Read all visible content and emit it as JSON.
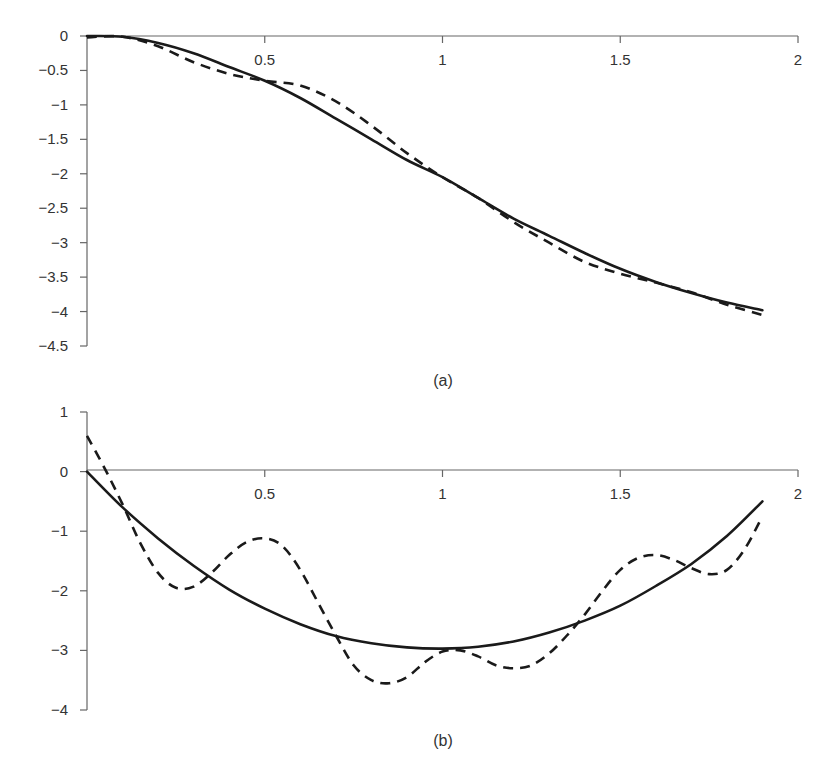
{
  "chart_data": [
    {
      "id": "a",
      "type": "line",
      "title": "",
      "caption": "(a)",
      "xlabel": "",
      "ylabel": "",
      "xlim": [
        0,
        2
      ],
      "ylim": [
        -4.5,
        0
      ],
      "x_ticks": [
        0.5,
        1,
        1.5,
        2
      ],
      "x_tick_labels": [
        "0.5",
        "1",
        "1.5",
        "2"
      ],
      "y_ticks": [
        0,
        -0.5,
        -1,
        -1.5,
        -2,
        -2.5,
        -3,
        -3.5,
        -4,
        -4.5
      ],
      "y_tick_labels": [
        "0",
        "−0.5",
        "−1",
        "−1.5",
        "−2",
        "−2.5",
        "−3",
        "−3.5",
        "−4",
        "−4.5"
      ],
      "grid": false,
      "legend": null,
      "x": [
        0,
        0.1,
        0.2,
        0.3,
        0.4,
        0.5,
        0.6,
        0.7,
        0.8,
        0.9,
        1.0,
        1.1,
        1.2,
        1.3,
        1.4,
        1.5,
        1.6,
        1.7,
        1.8,
        1.9
      ],
      "series": [
        {
          "name": "solid",
          "style": "solid",
          "values": [
            0,
            -0.01,
            -0.1,
            -0.25,
            -0.45,
            -0.65,
            -0.9,
            -1.2,
            -1.5,
            -1.8,
            -2.05,
            -2.35,
            -2.65,
            -2.9,
            -3.15,
            -3.38,
            -3.57,
            -3.73,
            -3.87,
            -3.98
          ]
        },
        {
          "name": "dashed",
          "style": "dashed",
          "values": [
            -0.02,
            -0.01,
            -0.15,
            -0.38,
            -0.55,
            -0.65,
            -0.72,
            -0.95,
            -1.3,
            -1.7,
            -2.05,
            -2.35,
            -2.7,
            -3.0,
            -3.28,
            -3.45,
            -3.58,
            -3.72,
            -3.9,
            -4.05
          ]
        }
      ]
    },
    {
      "id": "b",
      "type": "line",
      "title": "",
      "caption": "(b)",
      "xlabel": "",
      "ylabel": "",
      "xlim": [
        0,
        2
      ],
      "ylim": [
        -4,
        1
      ],
      "x_ticks": [
        0.5,
        1,
        1.5,
        2
      ],
      "x_tick_labels": [
        "0.5",
        "1",
        "1.5",
        "2"
      ],
      "y_ticks": [
        1,
        0,
        -1,
        -2,
        -3,
        -4
      ],
      "y_tick_labels": [
        "1",
        "0",
        "−1",
        "−2",
        "−3",
        "−4"
      ],
      "grid": false,
      "legend": null,
      "series": [
        {
          "name": "solid",
          "style": "solid",
          "x": [
            0,
            0.1,
            0.2,
            0.3,
            0.4,
            0.5,
            0.6,
            0.7,
            0.8,
            0.9,
            1.0,
            1.1,
            1.2,
            1.3,
            1.4,
            1.5,
            1.6,
            1.7,
            1.8,
            1.9
          ],
          "values": [
            0,
            -0.6,
            -1.12,
            -1.58,
            -1.98,
            -2.3,
            -2.56,
            -2.76,
            -2.88,
            -2.95,
            -2.97,
            -2.94,
            -2.85,
            -2.7,
            -2.5,
            -2.25,
            -1.92,
            -1.55,
            -1.08,
            -0.5
          ]
        },
        {
          "name": "dashed",
          "style": "dashed",
          "x": [
            0,
            0.05,
            0.1,
            0.15,
            0.2,
            0.25,
            0.3,
            0.35,
            0.4,
            0.45,
            0.5,
            0.55,
            0.6,
            0.65,
            0.7,
            0.75,
            0.8,
            0.85,
            0.9,
            0.95,
            1.0,
            1.05,
            1.1,
            1.15,
            1.2,
            1.25,
            1.3,
            1.35,
            1.4,
            1.45,
            1.5,
            1.55,
            1.6,
            1.65,
            1.7,
            1.75,
            1.8,
            1.85,
            1.9
          ],
          "values": [
            0.6,
            0.05,
            -0.55,
            -1.2,
            -1.7,
            -1.95,
            -1.93,
            -1.7,
            -1.4,
            -1.18,
            -1.12,
            -1.25,
            -1.65,
            -2.2,
            -2.75,
            -3.25,
            -3.5,
            -3.55,
            -3.45,
            -3.2,
            -3.02,
            -3.0,
            -3.1,
            -3.25,
            -3.3,
            -3.25,
            -3.05,
            -2.75,
            -2.4,
            -2.0,
            -1.65,
            -1.45,
            -1.4,
            -1.48,
            -1.62,
            -1.72,
            -1.65,
            -1.3,
            -0.75
          ]
        }
      ]
    }
  ],
  "layout_px": {
    "a": {
      "x0": 87,
      "x2": 798,
      "y_top_val": 0,
      "y_top_px": 36,
      "y_bot_val": -4.5,
      "y_bot_px": 346,
      "axis_y_px": 36,
      "caption_x": 443,
      "caption_y": 386
    },
    "b": {
      "x0": 87,
      "x2": 798,
      "y_top_val": 1,
      "y_top_px": 412,
      "y_bot_val": -4,
      "y_bot_px": 710,
      "axis_y_px": 470,
      "caption_x": 443,
      "caption_y": 746
    }
  }
}
